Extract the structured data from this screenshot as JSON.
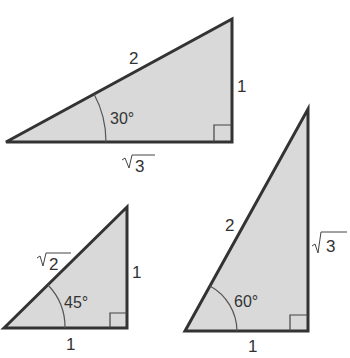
{
  "diagram": {
    "colors": {
      "fill": "#d9d9d9",
      "stroke": "#333333",
      "background": "#ffffff"
    },
    "triangles": [
      {
        "name": "30-60-90 (30° shown)",
        "angle_label": "30°",
        "hypotenuse_label": "2",
        "vertical_leg_label": "1",
        "horizontal_leg_label": "√3",
        "horizontal_leg_radicand": "3",
        "right_angle_marker": true
      },
      {
        "name": "45-45-90",
        "angle_label": "45°",
        "hypotenuse_label": "√2",
        "hypotenuse_radicand": "2",
        "vertical_leg_label": "1",
        "horizontal_leg_label": "1",
        "right_angle_marker": true
      },
      {
        "name": "30-60-90 (60° shown)",
        "angle_label": "60°",
        "hypotenuse_label": "2",
        "vertical_leg_label": "√3",
        "vertical_leg_radicand": "3",
        "horizontal_leg_label": "1",
        "right_angle_marker": true
      }
    ]
  }
}
